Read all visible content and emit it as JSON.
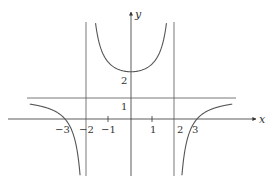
{
  "chart_data": {
    "type": "line",
    "title": "",
    "xlabel": "x",
    "ylabel": "y",
    "xlim": [
      -4.8,
      5.7
    ],
    "ylim": [
      -3.7,
      3.9
    ],
    "grid": false,
    "legend": null,
    "x_ticks": [
      -3,
      -2,
      -1,
      1,
      2,
      3
    ],
    "x_tick_labels": [
      "−3",
      "−2",
      "−1",
      "1",
      "2",
      "3"
    ],
    "y_tick_labels": [
      "1",
      "2"
    ],
    "asymptotes": {
      "vertical": [
        -2,
        2
      ],
      "horizontal": [
        1
      ]
    },
    "series": [
      {
        "name": "f(x) = (x^2 - 9)/(x^2 - 4)",
        "segments": [
          {
            "x": [
              -4.5,
              -4.0,
              -3.5,
              -3.0,
              -2.6,
              -2.3,
              -2.15
            ],
            "y": [
              0.7,
              0.58,
              0.35,
              0.0,
              -0.89,
              -3.0,
              -3.5
            ]
          },
          {
            "x": [
              -1.85,
              -1.5,
              -1.0,
              -0.5,
              0.0,
              0.5,
              1.0,
              1.5,
              1.85
            ],
            "y": [
              3.4,
              3.86,
              2.67,
              2.33,
              2.25,
              2.33,
              2.67,
              3.86,
              3.4
            ]
          },
          {
            "x": [
              2.15,
              2.3,
              2.6,
              3.0,
              3.5,
              4.0,
              4.5
            ],
            "y": [
              -3.5,
              -3.0,
              -0.89,
              0.0,
              0.35,
              0.58,
              0.7
            ]
          }
        ]
      }
    ],
    "annotations": [
      "y-intercept at 2.25",
      "zeros at x = -3 and x = 3"
    ]
  },
  "axes": {
    "x_label": "x",
    "y_label": "y",
    "x_ticks": [
      {
        "value": -3,
        "label": "−3"
      },
      {
        "value": -2,
        "label": "−2"
      },
      {
        "value": -1,
        "label": "−1"
      },
      {
        "value": 1,
        "label": "1"
      },
      {
        "value": 2,
        "label": "2"
      },
      {
        "value": 3,
        "label": "3"
      }
    ],
    "y_ticks": [
      {
        "value": 1,
        "label": "1"
      },
      {
        "value": 2,
        "label": "2"
      }
    ]
  },
  "style": {
    "curve_color": "#555555",
    "axis_color": "#333333",
    "asymptote_color": "#555555"
  }
}
